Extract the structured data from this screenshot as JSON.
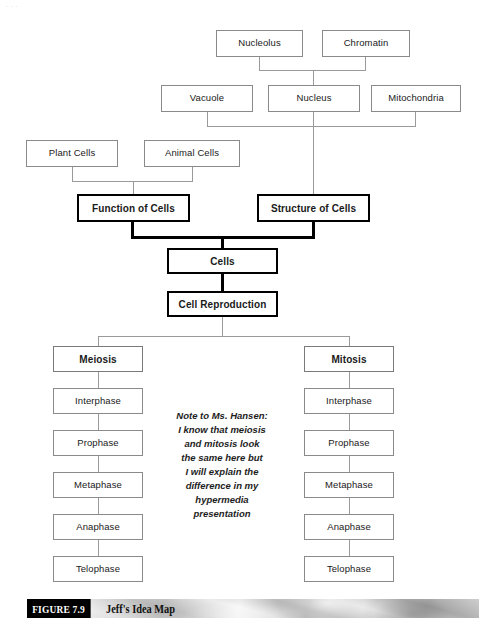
{
  "figure": {
    "tag": "FIGURE 7.9",
    "title": "Jeff's Idea Map",
    "top_artifact": "..."
  },
  "diagram": {
    "title": "Jeff's Idea Map",
    "type": "concept-map",
    "nodes": {
      "nucleolus": "Nucleolus",
      "chromatin": "Chromatin",
      "vacuole": "Vacuole",
      "nucleus": "Nucleus",
      "mitochondria": "Mitochondria",
      "plant_cells": "Plant Cells",
      "animal_cells": "Animal Cells",
      "function_of_cells": "Function of Cells",
      "structure_of_cells": "Structure of Cells",
      "cells": "Cells",
      "cell_reproduction": "Cell Reproduction",
      "meiosis": "Meiosis",
      "mitosis": "Mitosis",
      "meiosis_interphase": "Interphase",
      "meiosis_prophase": "Prophase",
      "meiosis_metaphase": "Metaphase",
      "meiosis_anaphase": "Anaphase",
      "meiosis_telophase": "Telophase",
      "mitosis_interphase": "Interphase",
      "mitosis_prophase": "Prophase",
      "mitosis_metaphase": "Metaphase",
      "mitosis_anaphase": "Anaphase",
      "mitosis_telophase": "Telophase"
    },
    "note": {
      "line1": "Note to Ms. Hansen:",
      "line2": "I know that meiosis",
      "line3": "and mitosis look",
      "line4": "the same here but",
      "line5": "I will explain the",
      "line6": "difference in my",
      "line7": "hypermedia",
      "line8": "presentation"
    },
    "colors": {
      "box_border": "#8a8a8a",
      "emphasis_border": "#000000",
      "connector": "#9a9a9a",
      "emphasis_connector": "#000000",
      "background": "#ffffff",
      "caption_tag_bg": "#000000",
      "caption_tag_fg": "#ffffff"
    }
  }
}
